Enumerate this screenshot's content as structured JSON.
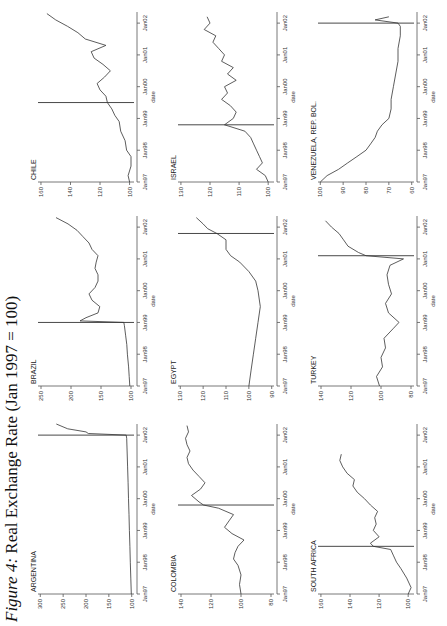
{
  "figure": {
    "title_lead": "Figure 4:",
    "title_rest": "Real Exchange Rate (Jan 1997 = 100)"
  },
  "chart_data": [
    {
      "type": "line",
      "title": "ARGENTINA",
      "xlabel": "date",
      "ylabel": "",
      "x_ticks": [
        "Jan97",
        "Jan98",
        "Jan99",
        "Jan00",
        "Jan01",
        "Jan02"
      ],
      "y_ticks": [
        100,
        150,
        200,
        250,
        300
      ],
      "ylim": [
        95,
        305
      ],
      "vline_x": 5.0,
      "x": [
        0,
        0.5,
        1,
        1.5,
        2,
        2.5,
        3,
        3.5,
        4,
        4.5,
        4.9,
        5.0,
        5.05,
        5.1,
        5.2,
        5.35
      ],
      "values": [
        101,
        102,
        103,
        104,
        105,
        106,
        107,
        108,
        109,
        110,
        111,
        112,
        195,
        200,
        240,
        265
      ]
    },
    {
      "type": "line",
      "title": "BRAZIL",
      "xlabel": "date",
      "ylabel": "",
      "x_ticks": [
        "Jan97",
        "Jan98",
        "Jan99",
        "Jan00",
        "Jan01",
        "Jan02"
      ],
      "y_ticks": [
        100,
        150,
        200,
        250
      ],
      "ylim": [
        95,
        255
      ],
      "vline_x": 2.0,
      "x": [
        0,
        0.3,
        0.6,
        1,
        1.3,
        1.6,
        1.9,
        2.0,
        2.05,
        2.15,
        2.3,
        2.5,
        2.7,
        2.9,
        3.1,
        3.3,
        3.5,
        3.7,
        3.9,
        4.1,
        4.3,
        4.5,
        4.7,
        4.9,
        5.1,
        5.3
      ],
      "values": [
        102,
        103,
        104,
        106,
        107,
        109,
        111,
        112,
        185,
        175,
        155,
        152,
        165,
        170,
        160,
        155,
        155,
        160,
        158,
        155,
        165,
        170,
        180,
        190,
        205,
        225
      ]
    },
    {
      "type": "line",
      "title": "CHILE",
      "xlabel": "date",
      "ylabel": "",
      "x_ticks": [
        "Jan97",
        "Jan98",
        "Jan99",
        "Jan00",
        "Jan01",
        "Jan02"
      ],
      "y_ticks": [
        100,
        120,
        140,
        160
      ],
      "ylim": [
        97,
        162
      ],
      "vline_x": 2.5,
      "x": [
        0,
        0.2,
        0.5,
        0.8,
        1,
        1.3,
        1.6,
        1.9,
        2.1,
        2.3,
        2.5,
        2.7,
        2.9,
        3.1,
        3.3,
        3.5,
        3.7,
        3.9,
        4.1,
        4.3,
        4.5,
        4.7,
        4.9,
        5.1,
        5.3
      ],
      "values": [
        100,
        101,
        99,
        99,
        102,
        103,
        106,
        107,
        110,
        112,
        115,
        116,
        120,
        122,
        117,
        113,
        118,
        124,
        126,
        116,
        130,
        135,
        142,
        150,
        156
      ]
    },
    {
      "type": "line",
      "title": "COLOMBIA",
      "xlabel": "date",
      "ylabel": "",
      "x_ticks": [
        "Jan97",
        "Jan98",
        "Jan99",
        "Jan00",
        "Jan01",
        "Jan02"
      ],
      "y_ticks": [
        80,
        100,
        120,
        140
      ],
      "ylim": [
        78,
        142
      ],
      "vline_x": 2.8,
      "x": [
        0,
        0.3,
        0.6,
        0.9,
        1.1,
        1.3,
        1.5,
        1.7,
        1.9,
        2.1,
        2.3,
        2.5,
        2.7,
        2.8,
        2.9,
        3.1,
        3.3,
        3.5,
        3.7,
        3.9,
        4.1,
        4.3,
        4.5,
        4.7,
        4.9,
        5.1,
        5.3
      ],
      "values": [
        100,
        101,
        100,
        102,
        105,
        104,
        102,
        98,
        106,
        111,
        108,
        105,
        115,
        125,
        128,
        133,
        127,
        124,
        128,
        132,
        135,
        136,
        134,
        136,
        137,
        135,
        136
      ]
    },
    {
      "type": "line",
      "title": "EGYPT",
      "xlabel": "date",
      "ylabel": "",
      "x_ticks": [
        "Jan97",
        "Jan98",
        "Jan99",
        "Jan00",
        "Jan01",
        "Jan02"
      ],
      "y_ticks": [
        90,
        100,
        110,
        120,
        130
      ],
      "ylim": [
        89,
        131
      ],
      "vline_x": 4.8,
      "x": [
        0,
        0.5,
        1,
        1.5,
        2,
        2.5,
        3,
        3.3,
        3.6,
        3.9,
        4.1,
        4.3,
        4.6,
        4.8,
        4.95,
        5.1,
        5.3
      ],
      "values": [
        100,
        99,
        98,
        97,
        96,
        95,
        96,
        97,
        100,
        104,
        108,
        110,
        110,
        114,
        118,
        120,
        123
      ]
    },
    {
      "type": "line",
      "title": "ISRAEL",
      "xlabel": "date",
      "ylabel": "",
      "x_ticks": [
        "Jan97",
        "Jan98",
        "Jan99",
        "Jan00",
        "Jan01",
        "Jan02"
      ],
      "y_ticks": [
        100,
        110,
        120,
        130
      ],
      "ylim": [
        98,
        131
      ],
      "vline_x": 1.8,
      "x": [
        0,
        0.2,
        0.4,
        0.6,
        0.8,
        1,
        1.2,
        1.4,
        1.6,
        1.8,
        2.0,
        2.2,
        2.4,
        2.6,
        2.8,
        3.0,
        3.2,
        3.4,
        3.6,
        3.8,
        4.0,
        4.2,
        4.4,
        4.6,
        4.8,
        5.0,
        5.2
      ],
      "values": [
        100,
        101,
        104,
        102,
        103,
        104,
        105,
        106,
        108,
        115,
        112,
        111,
        113,
        116,
        114,
        115,
        111,
        114,
        112,
        116,
        115,
        117,
        119,
        118,
        122,
        120,
        121
      ]
    },
    {
      "type": "line",
      "title": "SOUTH AFRICA",
      "xlabel": "date",
      "ylabel": "",
      "x_ticks": [
        "Jan97",
        "Jan98",
        "Jan99",
        "Jan00",
        "Jan01",
        "Jan02"
      ],
      "y_ticks": [
        100,
        120,
        140,
        160
      ],
      "ylim": [
        96,
        162
      ],
      "vline_x": 1.5,
      "x": [
        0,
        0.2,
        0.5,
        0.8,
        1.0,
        1.2,
        1.4,
        1.5,
        1.6,
        1.8,
        2.0,
        2.2,
        2.4,
        2.6,
        2.8,
        3.0,
        3.2,
        3.4,
        3.6,
        3.8,
        4.0,
        4.2,
        4.4
      ],
      "values": [
        100,
        98,
        101,
        105,
        108,
        110,
        112,
        124,
        126,
        120,
        124,
        122,
        123,
        121,
        126,
        130,
        135,
        138,
        137,
        142,
        145,
        147,
        146
      ]
    },
    {
      "type": "line",
      "title": "TURKEY",
      "xlabel": "date",
      "ylabel": "",
      "x_ticks": [
        "Jan97",
        "Jan98",
        "Jan99",
        "Jan00",
        "Jan01",
        "Jan02"
      ],
      "y_ticks": [
        80,
        100,
        120,
        140
      ],
      "ylim": [
        78,
        142
      ],
      "vline_x": 4.1,
      "x": [
        0,
        0.3,
        0.6,
        0.9,
        1.2,
        1.5,
        1.8,
        2.0,
        2.3,
        2.6,
        2.9,
        3.2,
        3.5,
        3.8,
        4.0,
        4.1,
        4.2,
        4.4,
        4.6,
        4.8,
        5.0,
        5.2
      ],
      "values": [
        101,
        103,
        99,
        100,
        97,
        98,
        92,
        88,
        95,
        97,
        93,
        95,
        96,
        94,
        85,
        110,
        115,
        122,
        125,
        128,
        133,
        137
      ]
    },
    {
      "type": "line",
      "title": "VENEZUELA, REP. BOL.",
      "xlabel": "date",
      "ylabel": "",
      "x_ticks": [
        "Jan97",
        "Jan98",
        "Jan99",
        "Jan00",
        "Jan01",
        "Jan02"
      ],
      "y_ticks": [
        60,
        70,
        80,
        90,
        100
      ],
      "ylim": [
        59,
        101
      ],
      "vline_x": 5.0,
      "x": [
        0,
        0.2,
        0.4,
        0.6,
        0.8,
        1.0,
        1.2,
        1.4,
        1.6,
        1.8,
        2.0,
        2.3,
        2.6,
        3.0,
        3.4,
        3.8,
        4.2,
        4.6,
        4.9,
        5.0,
        5.1,
        5.2
      ],
      "values": [
        100,
        97,
        92,
        88,
        84,
        80,
        78,
        76,
        75,
        73,
        70,
        69,
        69,
        68,
        67,
        66,
        66,
        65,
        65,
        66,
        76,
        70
      ]
    }
  ]
}
